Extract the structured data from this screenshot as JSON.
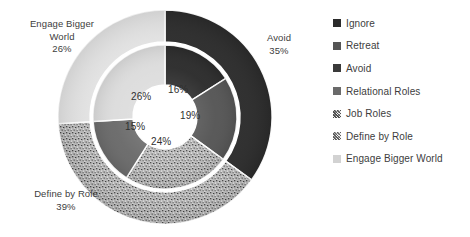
{
  "chart_data": {
    "type": "pie",
    "title": "",
    "subtitle": "",
    "variant": "nested-doughnut",
    "grid": false,
    "legend_position": "right",
    "center": {
      "x": 165,
      "y": 117
    },
    "radii": {
      "hole": 32,
      "inner_ring_outer": 72,
      "outer_ring_inner": 75,
      "outer_ring_outer": 107
    },
    "start_angle_deg": 0,
    "rings": [
      {
        "name": "outer",
        "categories": [
          "Avoid",
          "Define by Role",
          "Engage Bigger World"
        ],
        "values": [
          35,
          39,
          26
        ],
        "labels": [
          "Avoid\n35%",
          "Define by Role\n39%",
          "Engage Bigger\nWorld\n26%"
        ],
        "colors": [
          "#2b2b2b",
          "#9a9a9a",
          "#e2e2e2"
        ],
        "fills": [
          "solid",
          "speckled",
          "solid"
        ]
      },
      {
        "name": "inner",
        "categories": [
          "Ignore",
          "Retreat",
          "Job Roles",
          "Relational Roles",
          "Engage Bigger World"
        ],
        "values": [
          16,
          19,
          24,
          15,
          26
        ],
        "labels": [
          "16%",
          "19%",
          "24%",
          "15%",
          "26%"
        ],
        "colors": [
          "#2b2b2b",
          "#555555",
          "#9a9a9a",
          "#6a6a6a",
          "#dcdcdc"
        ],
        "fills": [
          "solid",
          "solid",
          "speckled",
          "solid",
          "solid"
        ]
      }
    ]
  },
  "outer_labels": [
    {
      "id": "engage-bigger-world",
      "text": "Engage Bigger\nWorld\n26%",
      "x": 8,
      "y": 18,
      "width": 108
    },
    {
      "id": "avoid",
      "text": "Avoid\n35%",
      "x": 248,
      "y": 32,
      "width": 62
    },
    {
      "id": "define-by-role",
      "text": "Define by Role\n39%",
      "x": 12,
      "y": 188,
      "width": 108
    }
  ],
  "inner_labels": [
    {
      "id": "ignore",
      "text": "16%",
      "x": 168,
      "y": 84
    },
    {
      "id": "retreat",
      "text": "19%",
      "x": 180,
      "y": 110
    },
    {
      "id": "job-roles",
      "text": "24%",
      "x": 151,
      "y": 136
    },
    {
      "id": "relational-roles",
      "text": "15%",
      "x": 125,
      "y": 121
    },
    {
      "id": "engage-bigger-world-inner",
      "text": "26%",
      "x": 131,
      "y": 91
    }
  ],
  "legend": {
    "items": [
      {
        "label": "Ignore",
        "color": "#2b2b2b",
        "fill": "solid"
      },
      {
        "label": "Retreat",
        "color": "#555555",
        "fill": "solid"
      },
      {
        "label": "Avoid",
        "color": "#3a3a3a",
        "fill": "solid"
      },
      {
        "label": "Relational Roles",
        "color": "#6a6a6a",
        "fill": "solid"
      },
      {
        "label": "Job Roles",
        "color": "#8c8c8c",
        "fill": "speckled"
      },
      {
        "label": "Define by Role",
        "color": "#a8a8a8",
        "fill": "speckled"
      },
      {
        "label": "Engage Bigger World",
        "color": "#d2d2d2",
        "fill": "solid"
      }
    ]
  }
}
